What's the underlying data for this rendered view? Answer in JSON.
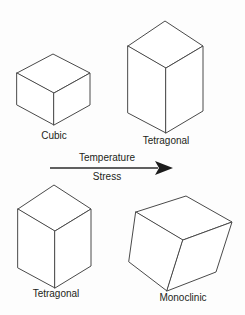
{
  "figure": {
    "type": "crystal-phase-transformation-diagram",
    "background_color": "#fdfdfd",
    "line_color": "#4a4a4a",
    "text_color": "#231f20",
    "width": 245,
    "height": 315
  },
  "shapes": {
    "top_left": {
      "label": "Cubic",
      "form": "cube",
      "position": "top-left"
    },
    "top_right": {
      "label": "Tetragonal",
      "form": "tall-rectangular-prism",
      "position": "top-right"
    },
    "bottom_left": {
      "label": "Tetragonal",
      "form": "tall-rectangular-prism",
      "position": "bottom-left"
    },
    "bottom_right": {
      "label": "Monoclinic",
      "form": "sheared-prism",
      "position": "bottom-right"
    }
  },
  "arrow": {
    "direction": "left-to-right",
    "label_above": "Temperature",
    "label_below": "Stress",
    "head_style": "solid-triangle"
  }
}
